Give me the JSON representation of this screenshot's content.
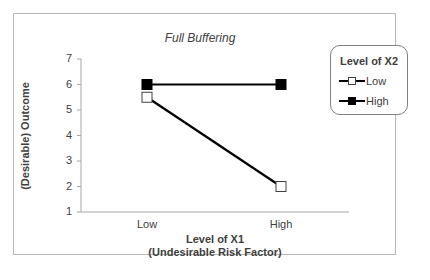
{
  "chart_data": {
    "type": "line",
    "title": "Full Buffering",
    "xlabel": "Level of X1\n(Undesirable Risk Factor)",
    "xlabel_lines": [
      "Level of X1",
      "(Undesirable Risk Factor)"
    ],
    "ylabel": "(Desirable) Outcome",
    "categories": [
      "Low",
      "High"
    ],
    "ylim": [
      1,
      7
    ],
    "yticks": [
      1,
      2,
      3,
      4,
      5,
      6,
      7
    ],
    "grid": false,
    "legend_title": "Level of X2",
    "legend_position": "right",
    "series": [
      {
        "name": "Low",
        "values": [
          5.5,
          2
        ],
        "marker": "hollow-square",
        "color": "#000000"
      },
      {
        "name": "High",
        "values": [
          6,
          6
        ],
        "marker": "filled-square",
        "color": "#000000"
      }
    ]
  },
  "colors": {
    "line": "#000000",
    "axis": "#a6a6a6",
    "frame_border": "#b8b8b8",
    "text": "#404040"
  }
}
